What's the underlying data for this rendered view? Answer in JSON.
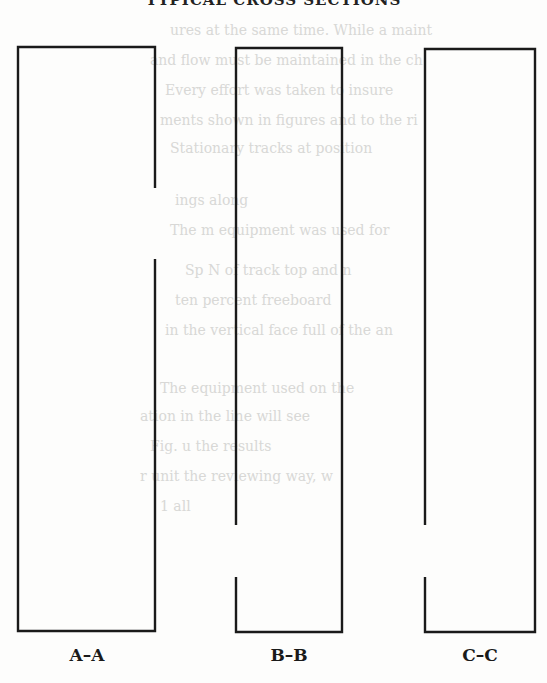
{
  "page": {
    "heading": "TYPICAL CROSS SECTIONS",
    "bleed_through_lines": [
      "ures at the same time. While a maint",
      "and flow must be maintained in the ch",
      "Every effort was taken to insure",
      "ments shown in figures and to the ri",
      "Stationary tracks at position",
      "ings along",
      "The m  equipment was used for",
      "Sp  N of track top and   n",
      "ten percent freeboard",
      "in the vertical face full of the   an",
      "The equipment used on   the",
      "   ation   in the   line   will   see",
      "   Fig.   u   the   results",
      "   r   unit   the   reviewing   way,  w",
      "1   all"
    ]
  },
  "diagram": {
    "stroke_color": "#1a1a1a",
    "stroke_width": 2.4,
    "sections": [
      {
        "id": "A-A",
        "label": "A–A",
        "x": 18,
        "y": 47,
        "width": 137,
        "height": 584,
        "gap": {
          "side": "right",
          "from_y": 188,
          "to_y": 259
        }
      },
      {
        "id": "B-B",
        "label": "B–B",
        "x": 236,
        "y": 48,
        "width": 106,
        "height": 584,
        "gap": {
          "side": "left",
          "from_y": 525,
          "to_y": 577
        }
      },
      {
        "id": "C-C",
        "label": "C–C",
        "x": 425,
        "y": 49,
        "width": 110,
        "height": 583,
        "gap": {
          "side": "left",
          "from_y": 525,
          "to_y": 577
        }
      }
    ]
  }
}
